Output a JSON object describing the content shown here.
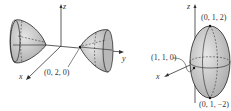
{
  "figure_left": {
    "title": "Hyperboloid of two sheets",
    "axes": {
      "x": "x",
      "y": "y",
      "z": "z"
    },
    "point_label": "(0, 2, 0)"
  },
  "figure_right": {
    "title": "Ellipsoid",
    "axes": {
      "x": "x",
      "z": "z"
    },
    "top_label": "(0, 1, 2)",
    "side_label": "(1, 1, 0)",
    "bottom_label": "(0, 1, −2)"
  },
  "colors": {
    "surface": "#c8c8c8",
    "stroke": "#222222",
    "axis": "#333333"
  }
}
